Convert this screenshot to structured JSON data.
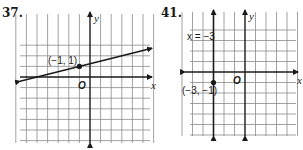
{
  "chart_data": [
    {
      "type": "line",
      "problem_number": "37.",
      "x_axis_label": "x",
      "y_axis_label": "y",
      "origin_label": "O",
      "xlim": [
        -7,
        6
      ],
      "ylim": [
        -7,
        3
      ],
      "grid": true,
      "line": {
        "kind": "linear",
        "point": [
          -1,
          1
        ],
        "slope": 0.25,
        "arrows": "both"
      },
      "points": [
        {
          "x": -1,
          "y": 1,
          "label": "(−1, 1)"
        }
      ]
    },
    {
      "type": "line",
      "problem_number": "41.",
      "x_axis_label": "x",
      "y_axis_label": "y",
      "origin_label": "O",
      "xlim": [
        -6,
        5
      ],
      "ylim": [
        -6,
        4
      ],
      "grid": true,
      "line": {
        "kind": "vertical",
        "x": -3,
        "label": "x = −3",
        "arrows": "both"
      },
      "points": [
        {
          "x": -3,
          "y": -1,
          "label": "(−3, −1)"
        }
      ]
    }
  ]
}
